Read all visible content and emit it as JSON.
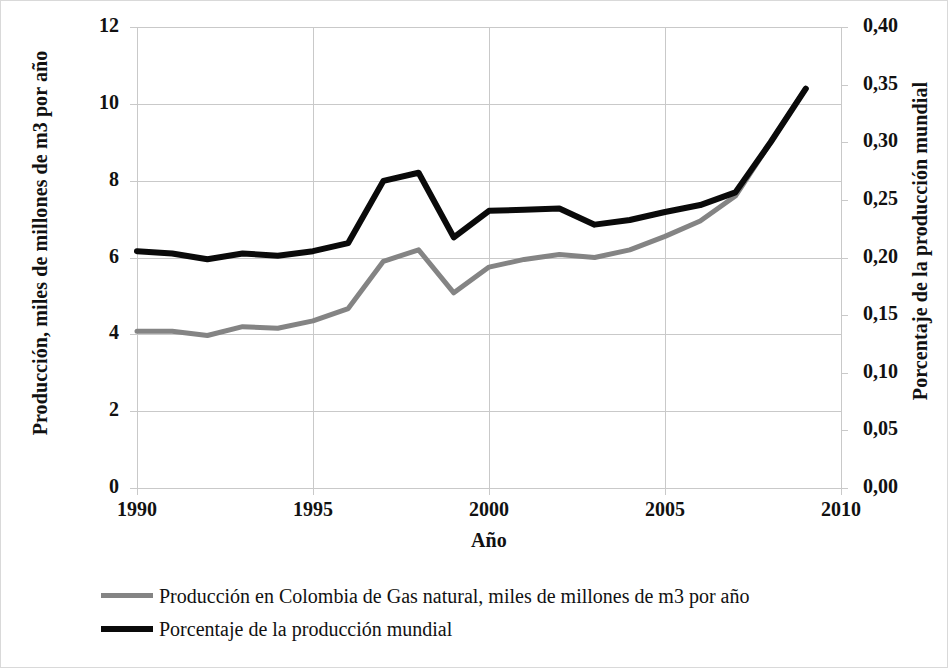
{
  "chart_data": {
    "type": "line",
    "title": "",
    "xlabel": "Año",
    "ylabel": "Producción, miles de millones de m3 por año",
    "ylabel_right": "Porcentaje de la producción mundial",
    "grid": true,
    "legend_position": "bottom-left",
    "xlim": [
      1990,
      2010
    ],
    "ylim": [
      0,
      12
    ],
    "ylim_right": [
      0.0,
      0.4
    ],
    "x": [
      1990,
      1991,
      1992,
      1993,
      1994,
      1995,
      1996,
      1997,
      1998,
      1999,
      2000,
      2001,
      2002,
      2003,
      2004,
      2005,
      2006,
      2007,
      2008,
      2009
    ],
    "xticks": [
      1990,
      1995,
      2000,
      2005,
      2010
    ],
    "xticklabels": [
      "1990",
      "1995",
      "2000",
      "2005",
      "2010"
    ],
    "yticks": [
      0,
      2,
      4,
      6,
      8,
      10,
      12
    ],
    "yticklabels": [
      "0",
      "2",
      "4",
      "6",
      "8",
      "10",
      "12"
    ],
    "yticks_right": [
      0.0,
      0.05,
      0.1,
      0.15,
      0.2,
      0.25,
      0.3,
      0.35,
      0.4
    ],
    "yticklabels_right": [
      "0,00",
      "0,05",
      "0,10",
      "0,15",
      "0,20",
      "0,25",
      "0,30",
      "0,35",
      "0,40"
    ],
    "series": [
      {
        "name": "Producción en Colombia de Gas natural, miles de millones de m3 por año",
        "axis": "left",
        "color": "#848484",
        "width": 5,
        "values": [
          4.08,
          4.08,
          3.97,
          4.2,
          4.16,
          4.35,
          4.67,
          5.9,
          6.2,
          5.08,
          5.75,
          5.95,
          6.08,
          6.0,
          6.2,
          6.55,
          6.95,
          7.6,
          9.0,
          10.4
        ]
      },
      {
        "name": "Porcentaje de la producción mundial",
        "axis": "right",
        "color": "#0a0a0a",
        "width": 6,
        "values": [
          0.2055,
          0.2035,
          0.1985,
          0.2035,
          0.2015,
          0.2055,
          0.2125,
          0.2665,
          0.2735,
          0.2175,
          0.2405,
          0.2415,
          0.2425,
          0.2285,
          0.2325,
          0.2395,
          0.2455,
          0.2565,
          0.3,
          0.3465
        ]
      }
    ]
  },
  "axis": {
    "left_title": "Producción, miles de millones de m3 por año",
    "right_title": "Porcentaje de la producción mundial",
    "x_title": "Año"
  },
  "legend": {
    "items": [
      {
        "label": "Producción en Colombia de Gas natural, miles de millones de m3 por año",
        "color": "#848484",
        "style": "serie-gray"
      },
      {
        "label": "Porcentaje de la producción mundial",
        "color": "#0a0a0a",
        "style": "serie-black"
      }
    ]
  },
  "colors": {
    "series_gray": "#848484",
    "series_black": "#0a0a0a",
    "grid": "#c9c9c9",
    "text": "#111111",
    "background": "#ffffff"
  }
}
